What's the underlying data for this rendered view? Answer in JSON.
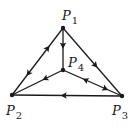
{
  "diagram": {
    "type": "directed-graph",
    "colors": {
      "stroke": "#1a1a1a",
      "background": "#ffffff"
    },
    "nodes": [
      {
        "id": "P1",
        "letter": "P",
        "sub": "1",
        "x": 63,
        "y": 28,
        "label_x": 62,
        "label_y": 9
      },
      {
        "id": "P2",
        "letter": "P",
        "sub": "2",
        "x": 12,
        "y": 95,
        "label_x": 6,
        "label_y": 104
      },
      {
        "id": "P3",
        "letter": "P",
        "sub": "3",
        "x": 122,
        "y": 96,
        "label_x": 112,
        "label_y": 104
      },
      {
        "id": "P4",
        "letter": "P",
        "sub": "4",
        "x": 63,
        "y": 70,
        "label_x": 68,
        "label_y": 56
      }
    ],
    "edges": [
      {
        "from": "P1",
        "to": "P4",
        "arrows": [
          {
            "t": 0.42,
            "dir": "forward"
          }
        ]
      },
      {
        "from": "P1",
        "to": "P2",
        "arrows": [
          {
            "t": 0.3,
            "dir": "backward"
          },
          {
            "t": 0.68,
            "dir": "forward"
          }
        ]
      },
      {
        "from": "P1",
        "to": "P3",
        "arrows": [
          {
            "t": 0.55,
            "dir": "forward"
          }
        ]
      },
      {
        "from": "P4",
        "to": "P2",
        "arrows": [
          {
            "t": 0.35,
            "dir": "forward"
          }
        ]
      },
      {
        "from": "P4",
        "to": "P3",
        "arrows": [
          {
            "t": 0.38,
            "dir": "backward"
          },
          {
            "t": 0.72,
            "dir": "forward"
          }
        ]
      },
      {
        "from": "P3",
        "to": "P2",
        "arrows": [
          {
            "t": 0.53,
            "dir": "forward"
          }
        ]
      }
    ]
  }
}
